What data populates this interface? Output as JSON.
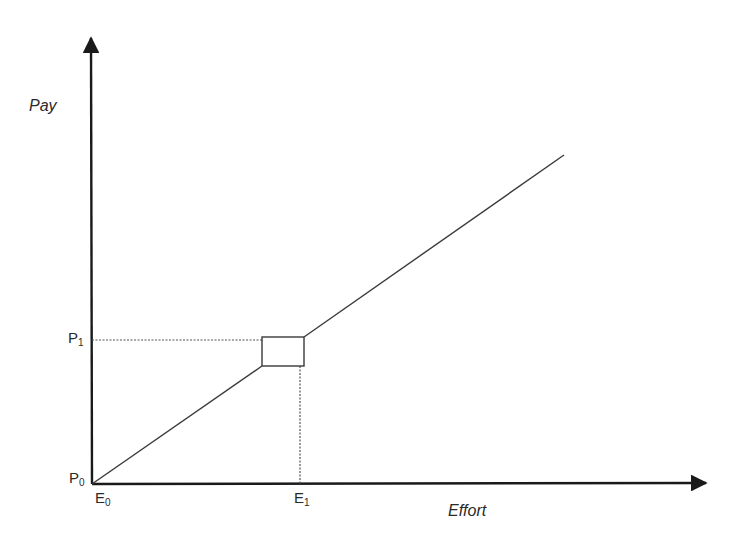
{
  "diagram": {
    "type": "piecewise-linear pay-effort schedule",
    "y_axis_label": "Pay",
    "x_axis_label": "Effort",
    "y_ticks": [
      {
        "base": "P",
        "sub": "1"
      },
      {
        "base": "P",
        "sub": "0"
      }
    ],
    "x_ticks": [
      {
        "base": "E",
        "sub": "0"
      },
      {
        "base": "E",
        "sub": "1"
      }
    ],
    "colors": {
      "axis": "#1a1a1a",
      "line": "#3a3a3a",
      "dotted": "#555555",
      "background": "#ffffff"
    },
    "geometry": {
      "origin": [
        92,
        484
      ],
      "y_axis_top": [
        91,
        38
      ],
      "x_axis_right": [
        706,
        483
      ],
      "segment_low": [
        [
          92,
          484
        ],
        [
          262,
          366
        ]
      ],
      "box": {
        "x": 262,
        "y": 337,
        "w": 42,
        "h": 29
      },
      "segment_high": [
        [
          304,
          337
        ],
        [
          564,
          155
        ]
      ],
      "p1_dotted": [
        [
          92,
          340
        ],
        [
          262,
          340
        ]
      ],
      "e1_dotted": [
        [
          300,
          366
        ],
        [
          300,
          484
        ]
      ]
    }
  }
}
